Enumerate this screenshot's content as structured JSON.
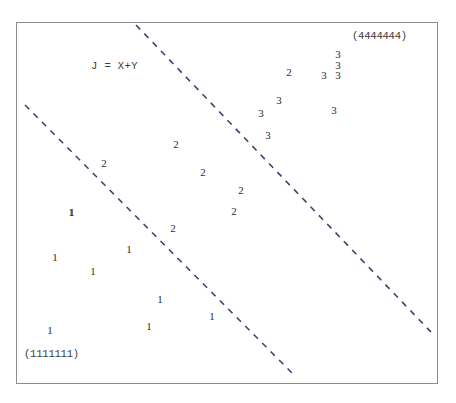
{
  "figure": {
    "background_color": "#ffffff",
    "frame": {
      "name": "plot-frame",
      "x": 16,
      "y": 22,
      "width": 422,
      "height": 362,
      "border_color": "#8d8d8d"
    }
  },
  "annotations": {
    "equation": "J = X+Y",
    "class_label_top_right": "(4444444)",
    "class_label_bottom_left": "(1111111)"
  },
  "boundaries": {
    "stroke_color": "#3f3f6b",
    "dash_pattern": "6 6",
    "stroke_width": 1.6,
    "lines": [
      {
        "name": "upper-boundary",
        "x1": 136,
        "y1": 25,
        "x2": 431,
        "y2": 332
      },
      {
        "name": "lower-boundary",
        "x1": 25,
        "y1": 105,
        "x2": 296,
        "y2": 377
      }
    ]
  },
  "chart_data": {
    "type": "scatter",
    "title": "",
    "subtitle": "",
    "xlabel": "",
    "ylabel": "",
    "xlim": [
      16,
      438
    ],
    "ylim": [
      22,
      384
    ],
    "grid": false,
    "axis_ticks": false,
    "legend": "none",
    "marker_style": "class-digit-glyph",
    "annotations": [
      {
        "text": "J = X+Y",
        "x": 91,
        "y": 60,
        "role": "boundary-equation"
      },
      {
        "text": "(4444444)",
        "x": 352,
        "y": 30,
        "role": "region-label"
      },
      {
        "text": "(1111111)",
        "x": 24,
        "y": 348,
        "role": "region-label"
      }
    ],
    "series": [
      {
        "name": "1",
        "label": "Class 1",
        "count": 9,
        "points": [
          {
            "x": 72,
            "y": 212
          },
          {
            "x": 55,
            "y": 257
          },
          {
            "x": 129,
            "y": 249
          },
          {
            "x": 93,
            "y": 271
          },
          {
            "x": 160,
            "y": 299
          },
          {
            "x": 212,
            "y": 316
          },
          {
            "x": 149,
            "y": 326
          },
          {
            "x": 50,
            "y": 330
          },
          {
            "x": 71,
            "y": 212
          }
        ]
      },
      {
        "name": "2",
        "label": "Class 2",
        "count": 7,
        "points": [
          {
            "x": 289,
            "y": 72
          },
          {
            "x": 104,
            "y": 163
          },
          {
            "x": 176,
            "y": 144
          },
          {
            "x": 203,
            "y": 172
          },
          {
            "x": 241,
            "y": 190
          },
          {
            "x": 234,
            "y": 211
          },
          {
            "x": 173,
            "y": 228
          }
        ]
      },
      {
        "name": "3",
        "label": "Class 3",
        "count": 8,
        "points": [
          {
            "x": 338,
            "y": 54
          },
          {
            "x": 338,
            "y": 65
          },
          {
            "x": 324,
            "y": 75
          },
          {
            "x": 338,
            "y": 75
          },
          {
            "x": 279,
            "y": 100
          },
          {
            "x": 261,
            "y": 113
          },
          {
            "x": 334,
            "y": 110
          },
          {
            "x": 268,
            "y": 135
          }
        ]
      }
    ]
  }
}
